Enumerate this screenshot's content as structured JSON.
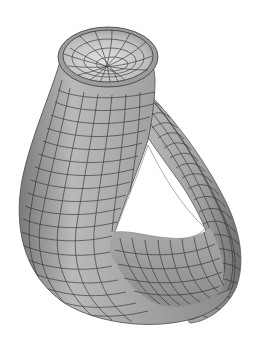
{
  "image": {
    "subject": "Klein bottle wireframe surface render",
    "background_color": "#ffffff",
    "surface_color_light": "#d8d8d8",
    "surface_color_mid": "#a9a9a9",
    "surface_color_dark": "#6e6e6e",
    "mesh_line_color": "#2a2a2a"
  },
  "caption": "Klein bottle"
}
